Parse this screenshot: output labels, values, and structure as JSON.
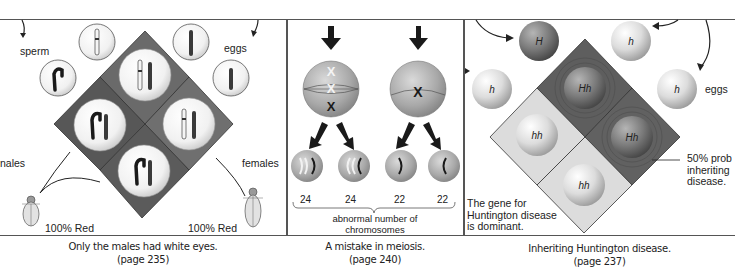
{
  "panels": [
    {
      "id": "sex-linked",
      "labels": {
        "sperm": "sperm",
        "eggs": "eggs",
        "males": "nales",
        "females": "females",
        "left_result": "100% Red",
        "right_result": "100% Red"
      },
      "caption": {
        "line1": "Only the males had white eyes.",
        "line2": "(page 235)"
      }
    },
    {
      "id": "meiosis",
      "counts": [
        "24",
        "24",
        "22",
        "22"
      ],
      "bracket_label": {
        "line1": "abnormal number of",
        "line2": "chromosomes"
      },
      "caption": {
        "line1": "A mistake in meiosis.",
        "line2": "(page 240)"
      }
    },
    {
      "id": "huntington",
      "gametes": {
        "sperm_top": "H",
        "sperm_left": "h",
        "egg_top": "h",
        "egg_right": "h"
      },
      "cells": {
        "top": "Hh",
        "right": "Hh",
        "left": "hh",
        "bottom": "hh"
      },
      "labels": {
        "eggs": "eggs",
        "probability": {
          "line1": "50% prob",
          "line2": "inheriting",
          "line3": "disease."
        },
        "note": {
          "line1": "The gene for",
          "line2": "Huntington disease",
          "line3": "is dominant."
        }
      },
      "caption": {
        "line1": "Inheriting Huntington disease.",
        "line2": "(page 237)"
      }
    }
  ],
  "colors": {
    "dark_cell": "#5e5e5e",
    "mid_cell": "#777777",
    "light_cell": "#dcdcdc",
    "frame_line": "#555555"
  }
}
